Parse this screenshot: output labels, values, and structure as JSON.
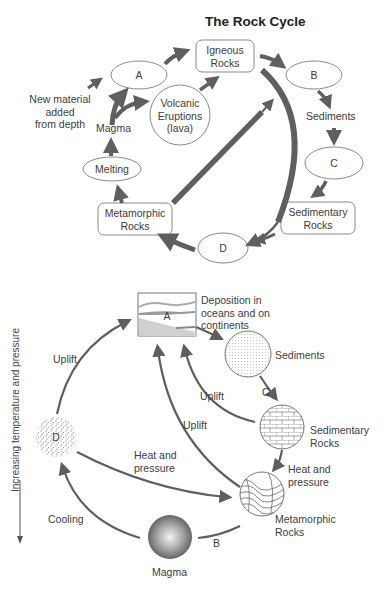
{
  "top_diagram": {
    "title": "The Rock Cycle",
    "nodes": {
      "igneous_line1": "Igneous",
      "igneous_line2": "Rocks",
      "a": "A",
      "b": "B",
      "c": "C",
      "d": "D",
      "volcanic_line1": "Volcanic",
      "volcanic_line2": "Eruptions",
      "volcanic_line3": "(lava)",
      "magma": "Magma",
      "melting": "Melting",
      "metamorphic_line1": "Metamorphic",
      "metamorphic_line2": "Rocks",
      "sediments": "Sediments",
      "sedimentary_line1": "Sedimentary",
      "sedimentary_line2": "Rocks",
      "new_material_line1": "New material",
      "new_material_line2": "added",
      "new_material_line3": "from depth"
    }
  },
  "bottom_diagram": {
    "axis_label": "Increasing temperature and pressure",
    "nodes": {
      "a": "A",
      "deposition_line1": "Deposition in",
      "deposition_line2": "oceans and on",
      "deposition_line3": "continents",
      "sediments": "Sediments",
      "c": "C",
      "sedimentary_line1": "Sedimentary",
      "sedimentary_line2": "Rocks",
      "heat_pressure_right_line1": "Heat and",
      "heat_pressure_right_line2": "pressure",
      "metamorphic_line1": "Metamorphic",
      "metamorphic_line2": "Rocks",
      "b": "B",
      "magma": "Magma",
      "cooling": "Cooling",
      "d": "D",
      "uplift_left": "Uplift",
      "uplift_mid": "Uplift",
      "uplift_right": "Uplift",
      "heat_pressure_mid_line1": "Heat and",
      "heat_pressure_mid_line2": "pressure"
    }
  },
  "colors": {
    "arrow": "#5f5f5f",
    "outline": "#8a8a8a",
    "text": "#3c3c3c"
  }
}
